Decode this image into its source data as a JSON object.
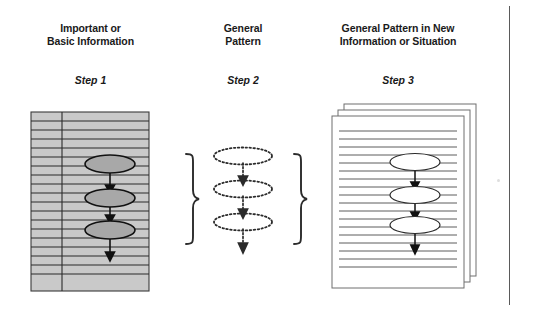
{
  "diagram": {
    "columns": [
      {
        "id": "col-1",
        "heading_lines": [
          "Important or",
          "Basic Information"
        ],
        "step_label": "Step 1",
        "panel_style": "shaded-ruled-page",
        "panel_fill": "#c9c9c9",
        "node_fill": "#a8a8a8",
        "node_count": 3,
        "arrow_style": "solid",
        "page_count": 1
      },
      {
        "id": "col-2",
        "heading_lines": [
          "General",
          "Pattern"
        ],
        "step_label": "Step 2",
        "panel_style": "none",
        "panel_fill": "#ffffff",
        "node_fill": "none",
        "node_count": 3,
        "arrow_style": "dotted",
        "page_count": 0,
        "brace_left": "}",
        "brace_right": "}"
      },
      {
        "id": "col-3",
        "heading_lines": [
          "General Pattern in New",
          "Information or Situation"
        ],
        "step_label": "Step 3",
        "panel_style": "stacked-ruled-pages",
        "panel_fill": "#ffffff",
        "node_fill": "#ffffff",
        "node_count": 3,
        "arrow_style": "solid",
        "page_count": 3
      }
    ],
    "colors": {
      "ink": "#1a1a1a",
      "rule_line": "#2b2b2b",
      "panel_shade": "#c9c9c9",
      "node_shade": "#a8a8a8",
      "page_border": "#6e6e6e",
      "page_edge_rule": "#5a5a5a",
      "background": "#ffffff"
    },
    "left_panel": {
      "x": 31,
      "y": 112,
      "w": 118,
      "h": 179,
      "rule_count": 18,
      "margin_line_x": 62
    },
    "middle_panel": {
      "brace_left_x": 186,
      "brace_right_x": 300,
      "brace_top_y": 155,
      "brace_bottom_y": 245,
      "ellipse_cx": 243
    },
    "right_panel": {
      "x": 332,
      "y": 116,
      "w": 132,
      "h": 172,
      "rule_count": 18,
      "stack_offset": 6
    }
  }
}
